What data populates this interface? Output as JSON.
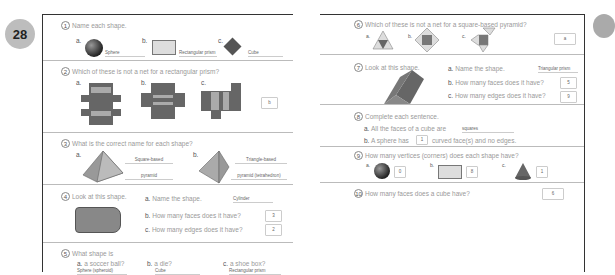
{
  "page_number": "28",
  "q1": {
    "num": "1",
    "text": "Name each shape.",
    "a_label": "a.",
    "a_ans": "Sphere",
    "b_label": "b.",
    "b_ans": "Rectangular prism",
    "c_label": "c.",
    "c_ans": "Cube"
  },
  "q2": {
    "num": "2",
    "text": "Which of these is not a net for a rectangular prism?",
    "a_label": "a.",
    "b_label": "b.",
    "c_label": "c.",
    "ans": "b"
  },
  "q3": {
    "num": "3",
    "text": "What is the correct name for each shape?",
    "a_label": "a.",
    "a_ans1": "Square-based",
    "a_ans2": "pyramid",
    "b_label": "b.",
    "b_ans1": "Triangle-based",
    "b_ans2": "pyramid (tetrahedron)"
  },
  "q4": {
    "num": "4",
    "text": "Look at this shape.",
    "a_text": "Name the shape.",
    "a_ans": "Cylinder",
    "b_text": "How many faces does it have?",
    "b_ans": "3",
    "c_text": "How many edges does it have?",
    "c_ans": "2",
    "a_label": "a.",
    "b_label": "b.",
    "c_label": "c."
  },
  "q5": {
    "num": "5",
    "text": "What shape is",
    "a_label": "a.",
    "a_text": "a soccer ball?",
    "a_ans": "Sphere (spheroid)",
    "b_label": "b.",
    "b_text": "a die?",
    "b_ans": "Cube",
    "c_label": "c.",
    "c_text": "a shoe box?",
    "c_ans": "Rectangular prism"
  },
  "q6": {
    "num": "6",
    "text": "Which of these is not a net for a square-based pyramid?",
    "a_label": "a.",
    "b_label": "b.",
    "c_label": "c.",
    "ans": "a"
  },
  "q7": {
    "num": "7",
    "text": "Look at this shape.",
    "a_label": "a.",
    "a_text": "Name the shape.",
    "a_ans": "Triangular prism",
    "b_label": "b.",
    "b_text": "How many faces does it have?",
    "b_ans": "5",
    "c_label": "c.",
    "c_text": "How many edges does it have?",
    "c_ans": "9"
  },
  "q8": {
    "num": "8",
    "text": "Complete each sentence.",
    "a_label": "a.",
    "a_text": "All the faces of a cube are",
    "a_ans": "squares",
    "b_label": "b.",
    "b_text1": "A sphere has",
    "b_ans": "1",
    "b_text2": "curved face(s) and no edges."
  },
  "q9": {
    "num": "9",
    "text": "How many vertices (corners) does each shape have?",
    "a_label": "a.",
    "a_ans": "0",
    "b_label": "b.",
    "b_ans": "8",
    "c_label": "c.",
    "c_ans": "1"
  },
  "q10": {
    "num": "10",
    "text": "How many faces does a cube have?",
    "ans": "6"
  }
}
